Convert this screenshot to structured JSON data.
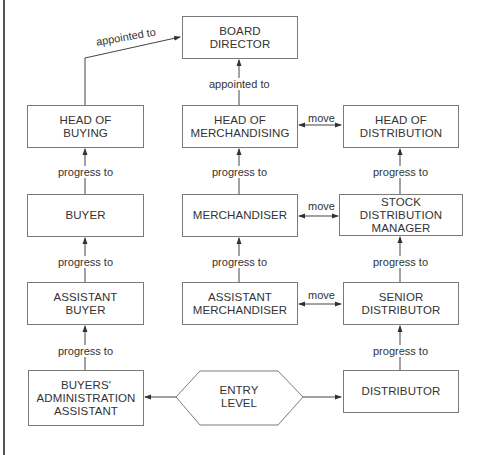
{
  "diagram": {
    "title": "",
    "nodes": {
      "board_director": "BOARD\nDIRECTOR",
      "head_of_buying": "HEAD OF\nBUYING",
      "head_of_merchandising": "HEAD OF\nMERCHANDISING",
      "head_of_distribution": "HEAD OF\nDISTRIBUTION",
      "buyer": "BUYER",
      "merchandiser": "MERCHANDISER",
      "stock_distribution_manager": "STOCK DISTRIBUTION\nMANAGER",
      "assistant_buyer": "ASSISTANT\nBUYER",
      "assistant_merchandiser": "ASSISTANT\nMERCHANDISER",
      "senior_distributor": "SENIOR\nDISTRIBUTOR",
      "buyers_admin_assistant": "BUYERS'\nADMINISTRATION\nASSISTANT",
      "entry_level": "ENTRY\nLEVEL",
      "distributor": "DISTRIBUTOR"
    },
    "edge_labels": {
      "buying_to_board": "appointed to",
      "merch_to_board": "appointed to",
      "move_head": "move",
      "move_mid": "move",
      "move_low": "move",
      "progress_buyer_to_head": "progress to",
      "progress_merch_to_head": "progress to",
      "progress_sdm_to_head": "progress to",
      "progress_asst_buyer_to_buyer": "progress to",
      "progress_asst_merch_to_merch": "progress to",
      "progress_senior_to_sdm": "progress to",
      "progress_admin_to_asst_buyer": "progress to",
      "progress_distributor_to_senior": "progress to"
    },
    "edges": [
      {
        "from": "head_of_buying",
        "to": "board_director",
        "label": "appointed to"
      },
      {
        "from": "head_of_merchandising",
        "to": "board_director",
        "label": "appointed to"
      },
      {
        "from": "head_of_merchandising",
        "to": "head_of_distribution",
        "label": "move",
        "bidirectional": true
      },
      {
        "from": "buyer",
        "to": "head_of_buying",
        "label": "progress to"
      },
      {
        "from": "merchandiser",
        "to": "head_of_merchandising",
        "label": "progress to"
      },
      {
        "from": "stock_distribution_manager",
        "to": "head_of_distribution",
        "label": "progress to"
      },
      {
        "from": "merchandiser",
        "to": "stock_distribution_manager",
        "label": "move",
        "bidirectional": true
      },
      {
        "from": "assistant_buyer",
        "to": "buyer",
        "label": "progress to"
      },
      {
        "from": "assistant_merchandiser",
        "to": "merchandiser",
        "label": "progress to"
      },
      {
        "from": "senior_distributor",
        "to": "stock_distribution_manager",
        "label": "progress to"
      },
      {
        "from": "assistant_merchandiser",
        "to": "senior_distributor",
        "label": "move",
        "bidirectional": true
      },
      {
        "from": "buyers_admin_assistant",
        "to": "assistant_buyer",
        "label": "progress to"
      },
      {
        "from": "distributor",
        "to": "senior_distributor",
        "label": "progress to"
      },
      {
        "from": "entry_level",
        "to": "buyers_admin_assistant",
        "label": ""
      },
      {
        "from": "entry_level",
        "to": "distributor",
        "label": ""
      }
    ],
    "colors": {
      "line": "#444444",
      "box_border": "#7a7a7a",
      "text": "#333333"
    }
  }
}
